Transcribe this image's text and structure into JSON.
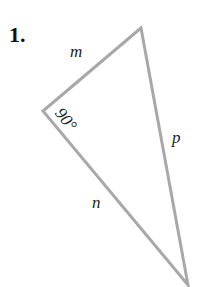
{
  "problem": {
    "number": "1."
  },
  "triangle": {
    "vertices": {
      "top": [
        141,
        28
      ],
      "left": [
        43,
        111
      ],
      "bottom": [
        188,
        285
      ]
    },
    "stroke_color": "#a8a8a8",
    "sides": {
      "m": "m",
      "n": "n",
      "p": "p"
    },
    "angle": "90°"
  }
}
